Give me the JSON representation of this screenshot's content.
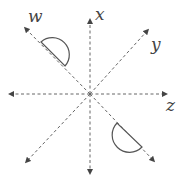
{
  "diagram": {
    "type": "axes-with-semicircles",
    "axes": [
      {
        "name": "x",
        "label": "x",
        "direction": "vertical"
      },
      {
        "name": "y",
        "label": "y",
        "direction": "diagonal-up-right"
      },
      {
        "name": "z",
        "label": "z",
        "direction": "horizontal"
      },
      {
        "name": "w",
        "label": "w",
        "direction": "diagonal-up-left"
      }
    ],
    "shapes": [
      {
        "name": "upper-semicircle",
        "on_axis": "w",
        "position": "upper-left"
      },
      {
        "name": "lower-semicircle",
        "on_axis": "w",
        "position": "lower-right"
      }
    ],
    "colors": {
      "lines": "#555555",
      "labels": "#444444"
    }
  }
}
